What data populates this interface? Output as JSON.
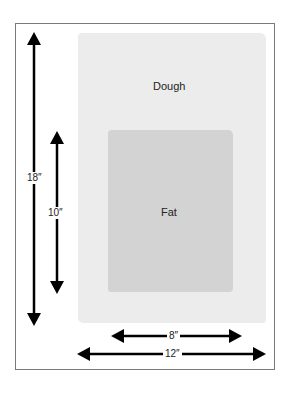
{
  "diagram": {
    "regions": {
      "dough": {
        "label": "Dough",
        "color": "#ececec"
      },
      "fat": {
        "label": "Fat",
        "color": "#d3d3d3"
      }
    },
    "dimensions": {
      "dough_height": "18″",
      "fat_height": "10″",
      "fat_width": "8″",
      "dough_width": "12″"
    }
  }
}
